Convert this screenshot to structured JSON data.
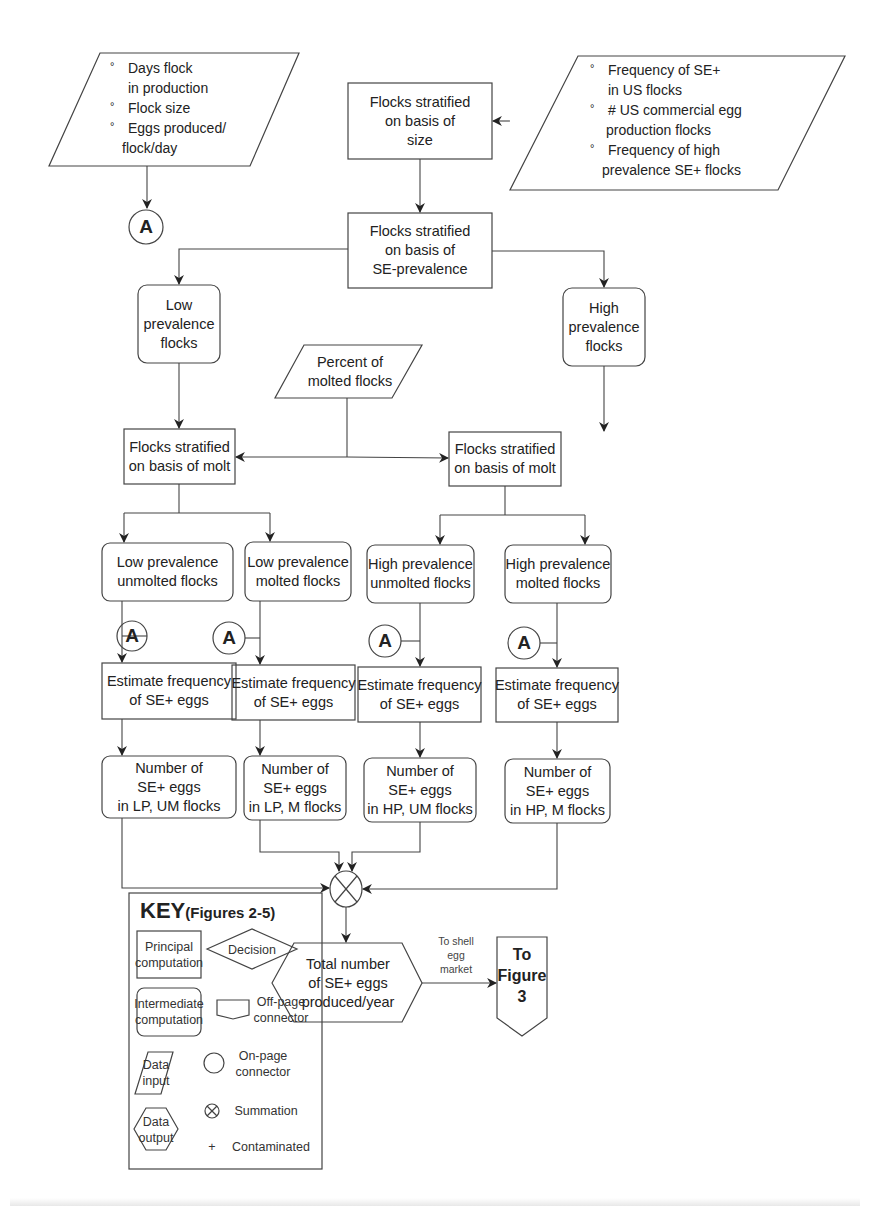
{
  "diagram": {
    "inputs": {
      "production_params": {
        "bullets": [
          {
            "line1": "Days flock",
            "line2": "in production"
          },
          {
            "line1": "Flock size",
            "line2": ""
          },
          {
            "line1": "Eggs produced/",
            "line2": "flock/day"
          }
        ]
      },
      "us_flock_params": {
        "bullets": [
          {
            "line1": "Frequency of SE+",
            "line2": "in US flocks"
          },
          {
            "line1": "# US commercial egg",
            "line2": "production flocks"
          },
          {
            "line1": "Frequency of high",
            "line2": "prevalence SE+ flocks"
          }
        ]
      },
      "molt_percent": {
        "line1": "Percent of",
        "line2": "molted flocks"
      }
    },
    "connector_label": "A",
    "boxes": {
      "strat_size": [
        "Flocks stratified",
        "on basis of",
        "size"
      ],
      "strat_prev": [
        "Flocks stratified",
        "on basis of",
        "SE-prevalence"
      ],
      "low_prev": [
        "Low",
        "prevalence",
        "flocks"
      ],
      "high_prev": [
        "High",
        "prevalence",
        "flocks"
      ],
      "strat_molt_low": [
        "Flocks stratified",
        "on basis of molt"
      ],
      "strat_molt_high": [
        "Flocks stratified",
        "on basis of molt"
      ]
    },
    "branches": [
      {
        "group": [
          "Low prevalence",
          "unmolted flocks"
        ],
        "estimate": [
          "Estimate frequency",
          "of SE+ eggs"
        ],
        "count": [
          "Number of",
          "SE+ eggs",
          "in LP, UM flocks"
        ]
      },
      {
        "group": [
          "Low prevalence",
          "molted flocks"
        ],
        "estimate": [
          "Estimate frequency",
          "of SE+ eggs"
        ],
        "count": [
          "Number of",
          "SE+ eggs",
          "in LP, M flocks"
        ]
      },
      {
        "group": [
          "High prevalence",
          "unmolted flocks"
        ],
        "estimate": [
          "Estimate frequency",
          "of SE+ eggs"
        ],
        "count": [
          "Number of",
          "SE+ eggs",
          "in HP, UM flocks"
        ]
      },
      {
        "group": [
          "High prevalence",
          "molted flocks"
        ],
        "estimate": [
          "Estimate frequency",
          "of SE+ eggs"
        ],
        "count": [
          "Number of",
          "SE+ eggs",
          "in HP, M flocks"
        ]
      }
    ],
    "output": [
      "Total number",
      "of SE+ eggs",
      "produced/year"
    ],
    "edge_label": [
      "To shell",
      "egg",
      "market"
    ],
    "offpage": [
      "To",
      "Figure",
      "3"
    ]
  },
  "key": {
    "title": "KEY",
    "subtitle": "(Figures 2-5)",
    "items": {
      "principal": [
        "Principal",
        "computation"
      ],
      "intermediate": [
        "Intermediate",
        "computation"
      ],
      "data_input": [
        "Data",
        "input"
      ],
      "data_output": [
        "Data",
        "output"
      ],
      "decision": "Decision",
      "offpage": [
        "Off-page",
        "connector"
      ],
      "onpage": [
        "On-page",
        "connector"
      ],
      "summation": "Summation",
      "contaminated_symbol": "+",
      "contaminated": "Contaminated"
    }
  }
}
